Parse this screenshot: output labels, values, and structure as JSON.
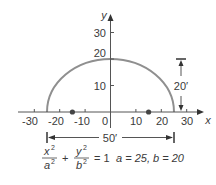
{
  "diagram": {
    "type": "semi-ellipse",
    "axes": {
      "x_label": "x",
      "y_label": "y",
      "x_ticks": [
        "-30",
        "-20",
        "-10",
        "0",
        "10",
        "20",
        "30"
      ],
      "x_tick_values": [
        -30,
        -20,
        -10,
        0,
        10,
        20,
        30
      ],
      "y_ticks": [
        "10",
        "20",
        "30"
      ],
      "y_tick_values": [
        10,
        20,
        30
      ]
    },
    "ellipse": {
      "a": 25,
      "b": 20,
      "color": "#8a8a8a"
    },
    "foci": [
      -15,
      15
    ],
    "dimensions": {
      "width_label": "50′",
      "height_label": "20′"
    },
    "equation": {
      "num1": "x",
      "den1": "a",
      "num2": "y",
      "den2": "b",
      "exp": "2",
      "plus": "+",
      "equals": "= 1",
      "params": "a = 25, b = 20"
    }
  }
}
